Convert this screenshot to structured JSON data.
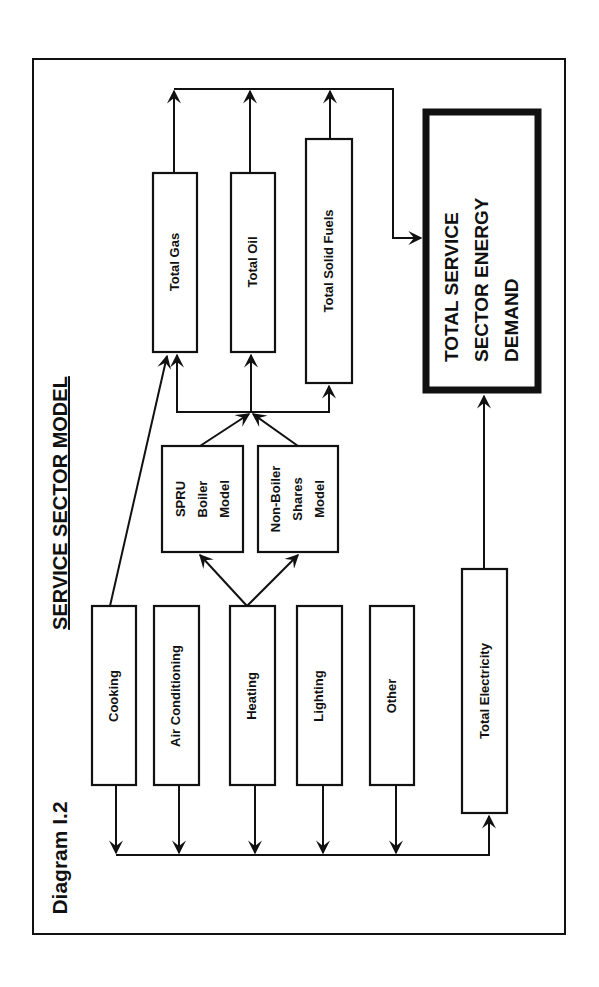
{
  "diagram": {
    "label": "Diagram I.2",
    "title": "SERVICE SECTOR MODEL",
    "orientation": "rotated 90° counter-clockwise (landscape page shown in portrait)"
  },
  "end_uses": [
    {
      "id": "cooking",
      "label": "Cooking"
    },
    {
      "id": "air-conditioning",
      "label": "Air Conditioning"
    },
    {
      "id": "heating",
      "label": "Heating"
    },
    {
      "id": "lighting",
      "label": "Lighting"
    },
    {
      "id": "other",
      "label": "Other"
    }
  ],
  "models": [
    {
      "id": "spru-boiler",
      "lines": [
        "SPRU",
        "Boiler",
        "Model"
      ]
    },
    {
      "id": "non-boiler-shares",
      "lines": [
        "Non-Boiler",
        "Shares",
        "Model"
      ]
    }
  ],
  "fuels": [
    {
      "id": "total-gas",
      "label": "Total Gas"
    },
    {
      "id": "total-oil",
      "label": "Total Oil"
    },
    {
      "id": "total-solid-fuels",
      "label": "Total Solid Fuels"
    },
    {
      "id": "total-electricity",
      "label": "Total Electricity"
    }
  ],
  "output": {
    "lines": [
      "TOTAL SERVICE",
      "SECTOR ENERGY",
      "DEMAND"
    ]
  },
  "flows": [
    {
      "from": "Cooking",
      "to": "Total Gas"
    },
    {
      "from": "Cooking",
      "to": "Total Electricity"
    },
    {
      "from": "Air Conditioning",
      "to": "Total Electricity"
    },
    {
      "from": "Heating",
      "to": "SPRU Boiler Model"
    },
    {
      "from": "Heating",
      "to": "Non-Boiler Shares Model"
    },
    {
      "from": "Heating",
      "to": "Total Electricity"
    },
    {
      "from": "Lighting",
      "to": "Total Electricity"
    },
    {
      "from": "Other",
      "to": "Total Electricity"
    },
    {
      "from": "SPRU Boiler Model",
      "to": "Total Gas / Total Oil / Total Solid Fuels"
    },
    {
      "from": "Non-Boiler Shares Model",
      "to": "Total Gas / Total Oil / Total Solid Fuels"
    },
    {
      "from": "Total Gas",
      "to": "TOTAL SERVICE SECTOR ENERGY DEMAND"
    },
    {
      "from": "Total Oil",
      "to": "TOTAL SERVICE SECTOR ENERGY DEMAND"
    },
    {
      "from": "Total Solid Fuels",
      "to": "TOTAL SERVICE SECTOR ENERGY DEMAND"
    },
    {
      "from": "Total Electricity",
      "to": "TOTAL SERVICE SECTOR ENERGY DEMAND"
    }
  ]
}
